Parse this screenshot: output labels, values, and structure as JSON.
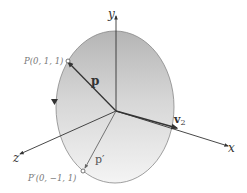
{
  "diagram": {
    "axes": {
      "x_label": "x",
      "y_label": "y",
      "z_label": "z"
    },
    "points": {
      "P_label": "P(0, 1, 1)",
      "P_prime_label": "P′(0, −1, 1)"
    },
    "vectors": {
      "p_label": "p",
      "p_prime_label": "p′",
      "v2_label": "v",
      "v2_subscript": "2"
    },
    "colors": {
      "disk_top": "#b9b9b9",
      "disk_bottom": "#f2f2f2",
      "axis": "#333333",
      "label_gray": "#777777",
      "vector": "#333333"
    }
  }
}
